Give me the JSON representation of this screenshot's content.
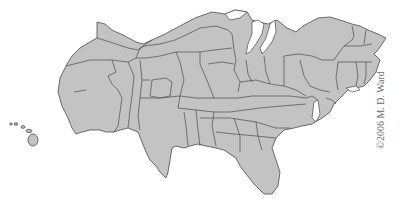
{
  "map": {
    "type": "cartogram",
    "subject": "United States (distorted by population)",
    "fill_color": "#c3c3c3",
    "border_color": "#4a4a4a",
    "background_color": "#ffffff",
    "regions_shown": [
      "contiguous-us",
      "hawaii"
    ]
  },
  "credit": {
    "text": "©2006 M. D. Ward",
    "orientation": "vertical"
  }
}
